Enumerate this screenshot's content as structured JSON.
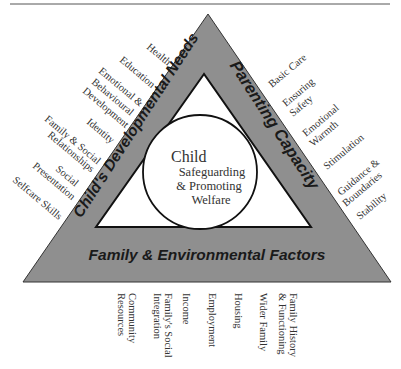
{
  "diagram": {
    "colors": {
      "band": "#8f8f8f",
      "inner": "#ffffff",
      "stroke": "#222222",
      "text": "#333333"
    },
    "sides": {
      "left": "Child's Developmental Needs",
      "right": "Parenting Capacity",
      "bottom": "Family & Environmental Factors"
    },
    "center": {
      "title": "Child",
      "lines": [
        "Safeguarding",
        "& Promoting",
        "Welfare"
      ]
    },
    "left_items": [
      [
        "Health"
      ],
      [
        "Education"
      ],
      [
        "Emotional &",
        "Behavioural",
        "Development"
      ],
      [
        "Identity"
      ],
      [
        "Family & Social",
        "Relationships"
      ],
      [
        "Social",
        "Presentation"
      ],
      [
        "Selfcare Skills"
      ]
    ],
    "right_items": [
      [
        "Basic Care"
      ],
      [
        "Ensuring",
        "Safety"
      ],
      [
        "Emotional",
        "Warmth"
      ],
      [
        "Stimulation"
      ],
      [
        "Guidance &",
        "Boundaries"
      ],
      [
        "Stability"
      ]
    ],
    "bottom_items": [
      [
        "Community",
        "Resources"
      ],
      [
        "Family's Social",
        "Integration"
      ],
      [
        "Income"
      ],
      [
        "Employment"
      ],
      [
        "Housing"
      ],
      [
        "Wider Family"
      ],
      [
        "Family History",
        "& Functioning"
      ]
    ]
  }
}
